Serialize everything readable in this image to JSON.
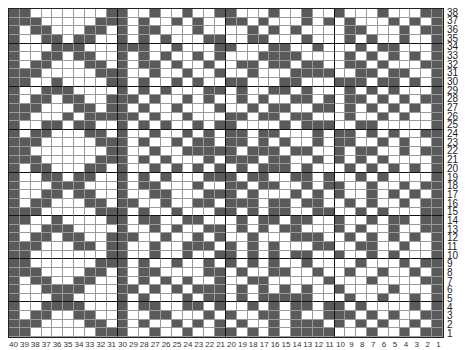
{
  "chart": {
    "title": "",
    "columns": 40,
    "rows": 38,
    "colors": {
      "filled": "#5a5a5a",
      "empty": "#ffffff",
      "grid": "#9a9a9a",
      "major_grid": "#111111"
    },
    "row_labels": [
      "38",
      "37",
      "36",
      "35",
      "34",
      "33",
      "32",
      "31",
      "30",
      "29",
      "28",
      "27",
      "26",
      "25",
      "24",
      "23",
      "22",
      "21",
      "20",
      "19",
      "18",
      "17",
      "16",
      "15",
      "14",
      "13",
      "12",
      "11",
      "10",
      "9",
      "8",
      "7",
      "6",
      "5",
      "4",
      "3",
      "2",
      "1"
    ],
    "col_labels": [
      "40",
      "39",
      "38",
      "37",
      "36",
      "35",
      "34",
      "33",
      "32",
      "31",
      "30",
      "29",
      "28",
      "27",
      "26",
      "25",
      "24",
      "23",
      "22",
      "21",
      "20",
      "19",
      "18",
      "17",
      "16",
      "15",
      "14",
      "13",
      "12",
      "11",
      "10",
      "9",
      "8",
      "7",
      "6",
      "5",
      "4",
      "3",
      "2",
      "1"
    ],
    "cells": [
      "1100000001100100100110001001001000100011",
      "1110000011101001010011010001010100010101",
      "1011000110101100010000101010000110001011",
      "1001101100101010001100110001000101001001",
      "1000111000111001000110001100100010110001",
      "1001101100101010010100011110000101010101",
      "1011000110101101001001101101100110100011",
      "1110000011100100100100100011110011011001",
      "1100100001101001010011000110001110110101",
      "1001110000101010001101001101000101010001",
      "1011011001110100101001010011010110101011",
      "1110001101101001000100101100110101010101",
      "1100010111110100100011011011000100101001",
      "1001101100101010010110000101110011000001",
      "1011000110100100101011011000101101010011",
      "1110000011101001011011010100101100101001",
      "1100000001100100111110111011001011001011",
      "1110000011101010001011101100101010100001",
      "1011000110100101010101011101000101010101",
      "1001101100101010001110110011010010100001",
      "1000111000101100010011011001011001001011",
      "1001101100100110001110100010101001010101",
      "1011000110110010011011101101100101001011",
      "1110000011101001000110101100110010100011",
      "1100100001101100110001011011001001011011",
      "1001110000100101001101010110001010010011",
      "1011011001110010010100100011100101010101",
      "1110001101100100111010101000110011001001",
      "1100000001100100100110101011001001010001",
      "1100000011101001001010101001000010001011",
      "1110000110101100001101001100100100100101",
      "1011001100101010100100110000010001000011",
      "1001111000110101011101010101001000010001",
      "1000110000101000101101011111000100100101",
      "1001111000101100110100101011011010000101",
      "1011001100100110001010011010011101010011",
      "1110000110101001010101001011101010100101",
      "1100000011100100100110101011110001001011"
    ]
  }
}
